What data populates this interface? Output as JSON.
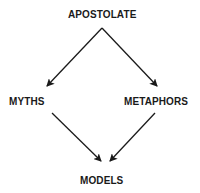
{
  "diagram": {
    "nodes": [
      {
        "id": "apostolate",
        "label": "APOSTOLATE"
      },
      {
        "id": "myths",
        "label": "MYTHS"
      },
      {
        "id": "metaphors",
        "label": "METAPHORS"
      },
      {
        "id": "models",
        "label": "MODELS"
      }
    ],
    "edges": [
      {
        "from": "apostolate",
        "to": "myths"
      },
      {
        "from": "apostolate",
        "to": "metaphors"
      },
      {
        "from": "myths",
        "to": "models"
      },
      {
        "from": "metaphors",
        "to": "models"
      }
    ],
    "colors": {
      "line": "#1a1a1a",
      "text": "#1a1a1a",
      "background": "#ffffff"
    }
  }
}
